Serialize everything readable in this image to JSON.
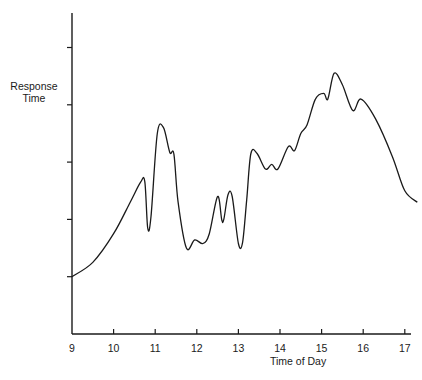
{
  "chart_data": {
    "type": "line",
    "title": "",
    "xlabel": "Time of Day",
    "ylabel": "Response Time",
    "x_ticks": [
      9,
      10,
      11,
      12,
      13,
      14,
      15,
      16,
      17
    ],
    "y_ticks_count": 5,
    "y_tick_labels": [],
    "xlim": [
      9,
      17.3
    ],
    "ylim": [
      0,
      5.6
    ],
    "grid": false,
    "legend": null,
    "series": [
      {
        "name": "Response Time",
        "color": "#1a1a1a",
        "x": [
          9.0,
          9.5,
          10.0,
          10.4,
          10.65,
          10.75,
          10.82,
          10.9,
          11.05,
          11.2,
          11.35,
          11.45,
          11.55,
          11.75,
          11.95,
          12.15,
          12.3,
          12.5,
          12.6,
          12.65,
          12.75,
          12.85,
          13.0,
          13.1,
          13.2,
          13.3,
          13.45,
          13.65,
          13.8,
          13.95,
          14.2,
          14.35,
          14.5,
          14.65,
          14.85,
          15.05,
          15.15,
          15.3,
          15.5,
          15.75,
          15.95,
          16.3,
          16.7,
          17.0,
          17.3
        ],
        "values": [
          1.0,
          1.25,
          1.75,
          2.3,
          2.65,
          2.66,
          1.85,
          2.05,
          3.5,
          3.6,
          3.17,
          3.14,
          2.3,
          1.5,
          1.64,
          1.58,
          1.75,
          2.4,
          1.99,
          2.0,
          2.43,
          2.4,
          1.58,
          1.6,
          2.34,
          3.15,
          3.15,
          2.88,
          2.96,
          2.88,
          3.27,
          3.2,
          3.5,
          3.65,
          4.1,
          4.2,
          4.1,
          4.55,
          4.35,
          3.9,
          4.1,
          3.75,
          3.1,
          2.5,
          2.3
        ]
      }
    ]
  },
  "labels": {
    "ylabel_line1": "Response",
    "ylabel_line2": "Time",
    "xlabel": "Time of Day"
  }
}
